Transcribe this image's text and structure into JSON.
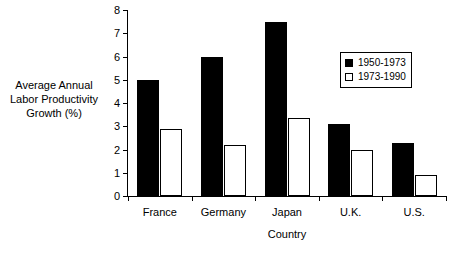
{
  "chart_data": {
    "type": "bar",
    "title": "",
    "categories": [
      "France",
      "Germany",
      "Japan",
      "U.K.",
      "U.S."
    ],
    "series": [
      {
        "name": "1950-1973",
        "style": "filled",
        "values": [
          5.0,
          6.0,
          7.5,
          3.1,
          2.3
        ]
      },
      {
        "name": "1973-1990",
        "style": "open",
        "values": [
          2.9,
          2.2,
          3.35,
          2.0,
          0.9
        ]
      }
    ],
    "xlabel": "Country",
    "ylabel": "Average Annual Labor Productivity Growth (%)",
    "ylabel_lines": [
      "Average Annual",
      "Labor Productivity",
      "Growth (%)"
    ],
    "ylim": [
      0,
      8
    ],
    "ytick_labels": [
      "0",
      "1",
      "2",
      "3",
      "4",
      "5",
      "6",
      "7",
      "8"
    ],
    "ytick_values": [
      0,
      1,
      2,
      3,
      4,
      5,
      6,
      7,
      8
    ],
    "grid": false,
    "legend_position": "upper right",
    "legend": [
      {
        "label": "1950-1973",
        "style": "filled",
        "color": "#000000"
      },
      {
        "label": "1973-1990",
        "style": "open",
        "color": "#ffffff"
      }
    ],
    "colors": {
      "series_1": "#000000",
      "series_2": "#ffffff",
      "axis": "#000000",
      "background": "#ffffff"
    }
  }
}
